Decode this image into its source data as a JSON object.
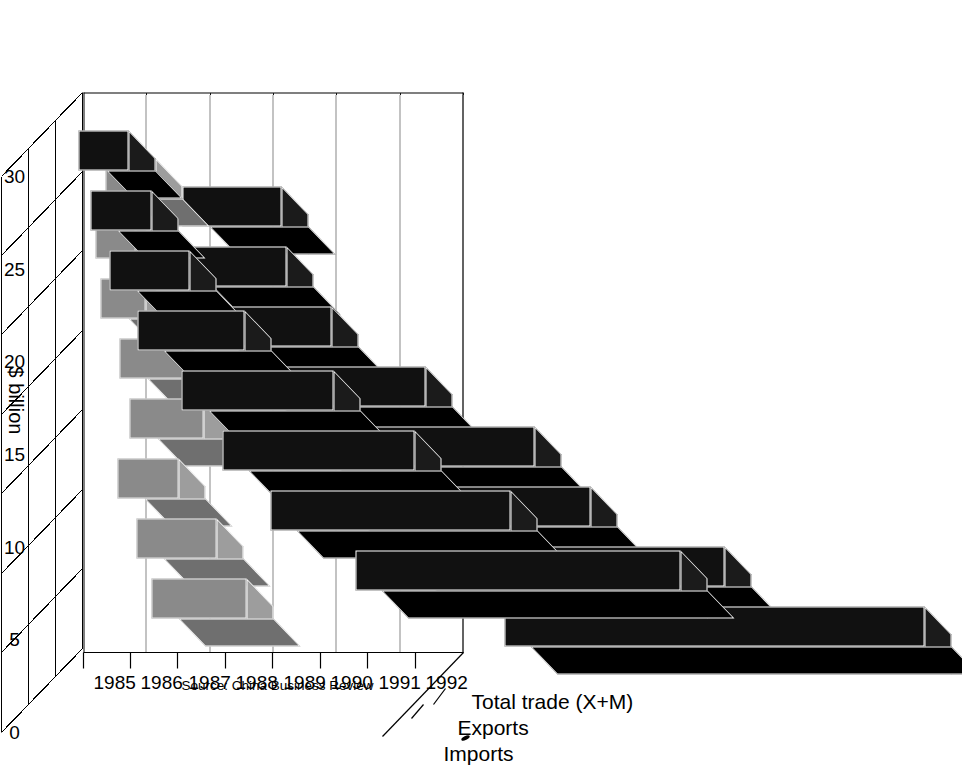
{
  "chart_data": {
    "type": "bar",
    "title": "",
    "subtitle": "",
    "xlabel": "",
    "ylabel": "$ billion",
    "ylim": [
      0,
      30
    ],
    "yticks": [
      0,
      5,
      10,
      15,
      20,
      25,
      30
    ],
    "ytick_labels": [
      "0",
      "5",
      "10",
      "15",
      "20",
      "25",
      "30"
    ],
    "categories": [
      "1985",
      "1986",
      "1987",
      "1988",
      "1989",
      "1990",
      "1991",
      "1992"
    ],
    "grid": "dotted horizontal gridlines on back wall",
    "legend_position": "right side, 3-D depth axis",
    "orientation": "image is rotated 90 degrees (chart reads bottom-to-top)",
    "projection": "3-D clustered bar, three depth rows",
    "series": [
      {
        "name": "Imports",
        "color": "#111111",
        "values": [
          3.9,
          4.8,
          6.3,
          8.5,
          12.0,
          15.2,
          19.0,
          25.7
        ]
      },
      {
        "name": "Exports",
        "color": "#8a8a8a",
        "values": [
          3.9,
          3.1,
          3.5,
          5.0,
          5.8,
          4.8,
          6.3,
          7.5
        ]
      },
      {
        "name": "Total trade (X+M)",
        "color": "#111111",
        "values": [
          7.8,
          8.0,
          9.8,
          13.5,
          17.8,
          20.0,
          25.3,
          33.2
        ]
      }
    ],
    "source": "Source: China Business Review"
  },
  "legend": {
    "items": [
      {
        "label": "Total trade (X+M)"
      },
      {
        "label": "Exports"
      },
      {
        "label": "Imports"
      }
    ]
  },
  "axes": {
    "value_axis_title": "$ billion",
    "value_ticks": [
      "30",
      "25",
      "20",
      "15",
      "10",
      "5",
      "0"
    ],
    "category_ticks": [
      "1992",
      "1991",
      "1990",
      "1989",
      "1988",
      "1987",
      "1986",
      "1985"
    ]
  },
  "footer": {
    "source": "Source: China Business Review"
  }
}
